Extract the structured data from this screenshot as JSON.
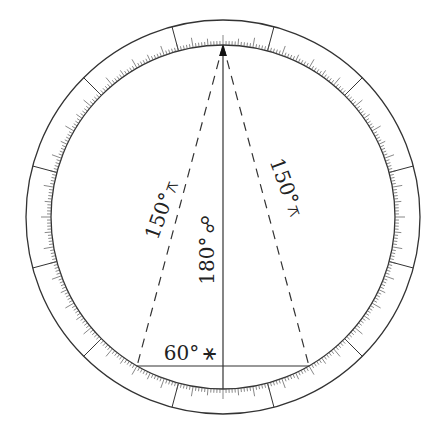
{
  "diagram": {
    "type": "zodiac-aspect-wheel",
    "center": [
      223,
      217
    ],
    "outer_radius": 197,
    "inner_radius": 172,
    "segments": 12,
    "segment_offset_deg": 15,
    "stroke_color": "#333333",
    "background": "#ffffff",
    "apex_point": [
      223,
      45
    ],
    "left_point": [
      137,
      366
    ],
    "right_point": [
      309,
      366
    ],
    "bottom_point": [
      223,
      389
    ]
  },
  "labels": {
    "left_dashed": {
      "degree": "150°",
      "symbol": "⚻",
      "aspect": "quincunx"
    },
    "right_dashed": {
      "degree": "150°",
      "symbol": "⚻",
      "aspect": "quincunx"
    },
    "vertical": {
      "degree": "180°",
      "symbol": "☍",
      "aspect": "opposition"
    },
    "chord": {
      "degree": "60°",
      "symbol": "⚹",
      "aspect": "sextile"
    }
  }
}
